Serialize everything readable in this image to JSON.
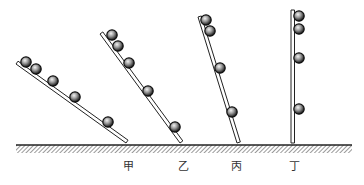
{
  "diagram": {
    "ground": {
      "y": 145,
      "x1": 16,
      "x2": 352,
      "hatch_height": 8
    },
    "boards": [
      {
        "label": "甲",
        "label_x": 128,
        "bottom": [
          126,
          143
        ],
        "top": [
          16,
          64
        ],
        "balls": [
          [
            26,
            62
          ],
          [
            36,
            69
          ],
          [
            53,
            81
          ],
          [
            75,
            97
          ],
          [
            108,
            122
          ]
        ]
      },
      {
        "label": "乙",
        "label_x": 183,
        "bottom": [
          180,
          143
        ],
        "top": [
          100,
          34
        ],
        "balls": [
          [
            112,
            35
          ],
          [
            118,
            46
          ],
          [
            129,
            63
          ],
          [
            148,
            91
          ],
          [
            175,
            127
          ]
        ]
      },
      {
        "label": "丙",
        "label_x": 236,
        "bottom": [
          237,
          143
        ],
        "top": [
          198,
          17
        ],
        "balls": [
          [
            206,
            20
          ],
          [
            210,
            31
          ],
          [
            220,
            68
          ],
          [
            232,
            112
          ]
        ]
      },
      {
        "label": "丁",
        "label_x": 294,
        "bottom": [
          291,
          143
        ],
        "top": [
          291,
          10
        ],
        "balls": [
          [
            299,
            16
          ],
          [
            299,
            29
          ],
          [
            299,
            58
          ],
          [
            299,
            109
          ]
        ]
      }
    ],
    "colors": {
      "line": "#222222",
      "ball_dark": "#111111",
      "ball_light": "#dddddd",
      "hatch": "#555555"
    }
  }
}
